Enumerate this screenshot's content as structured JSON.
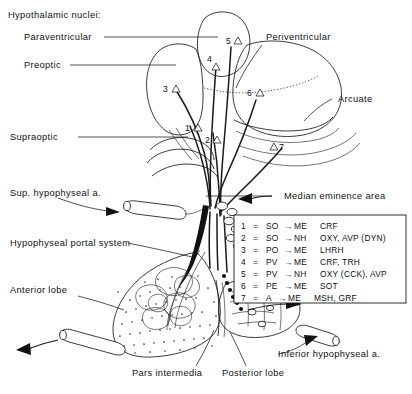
{
  "figure": {
    "title_group": "Hypothalamic nuclei:",
    "nuclei_labels": [
      {
        "id": "paraventricular",
        "text": "Paraventricular"
      },
      {
        "id": "preoptic",
        "text": "Preoptic"
      },
      {
        "id": "supraoptic",
        "text": "Supraoptic"
      },
      {
        "id": "periventricular",
        "text": "Periventricular"
      },
      {
        "id": "arcuate",
        "text": "Arcuate"
      }
    ],
    "structure_labels": [
      {
        "id": "median-eminence-area",
        "text": "Median eminence area"
      },
      {
        "id": "sup-hypophyseal-artery",
        "text": "Sup. hypophyseal a."
      },
      {
        "id": "hypophyseal-portal-system",
        "text": "Hypophyseal portal system"
      },
      {
        "id": "anterior-lobe",
        "text": "Anterior lobe"
      },
      {
        "id": "pars-intermedia",
        "text": "Pars intermedia"
      },
      {
        "id": "posterior-lobe",
        "text": "Posterior lobe"
      },
      {
        "id": "inferior-hypophyseal-artery",
        "text": "Inferior hypophyseal a."
      }
    ],
    "markers": [
      {
        "id": "marker-1",
        "text": "1"
      },
      {
        "id": "marker-2",
        "text": "2"
      },
      {
        "id": "marker-3",
        "text": "3"
      },
      {
        "id": "marker-4",
        "text": "4"
      },
      {
        "id": "marker-5",
        "text": "5"
      },
      {
        "id": "marker-6",
        "text": "6"
      },
      {
        "id": "marker-7",
        "text": "7"
      }
    ],
    "legend": {
      "equals": "=",
      "arrow": "→",
      "rows": [
        {
          "num": "1",
          "origin": "SO",
          "target": "ME",
          "peptides": "CRF"
        },
        {
          "num": "2",
          "origin": "SO",
          "target": "NH",
          "peptides": "OXY, AVP (DYN)"
        },
        {
          "num": "3",
          "origin": "PO",
          "target": "ME",
          "peptides": "LHRH"
        },
        {
          "num": "4",
          "origin": "PV",
          "target": "ME",
          "peptides": "CRF, TRH"
        },
        {
          "num": "5",
          "origin": "PV",
          "target": "NH",
          "peptides": "OXY (CCK), AVP"
        },
        {
          "num": "6",
          "origin": "PE",
          "target": "ME",
          "peptides": "SOT"
        },
        {
          "num": "7",
          "origin": "A",
          "target": "ME",
          "peptides": "MSH, GRF"
        }
      ]
    },
    "caption_clipped": " "
  },
  "colors": {
    "ink": "#1a1a1a",
    "background": "#ffffff",
    "caption_grey": "#7d7d7d"
  }
}
